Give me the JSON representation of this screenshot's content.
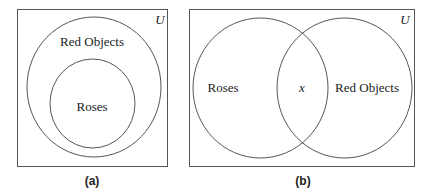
{
  "diagrams": [
    {
      "caption": "(a)",
      "universe_label": "U",
      "outer_set_label": "Red Objects",
      "inner_set_label": "Roses",
      "relation": "Roses is a subset of Red Objects"
    },
    {
      "caption": "(b)",
      "universe_label": "U",
      "left_set_label": "Roses",
      "intersection_label": "x",
      "right_set_label": "Red Objects",
      "relation": "Roses and Red Objects overlap"
    }
  ],
  "colors": {
    "stroke": "#555555",
    "text": "#222222",
    "background": "#ffffff"
  }
}
